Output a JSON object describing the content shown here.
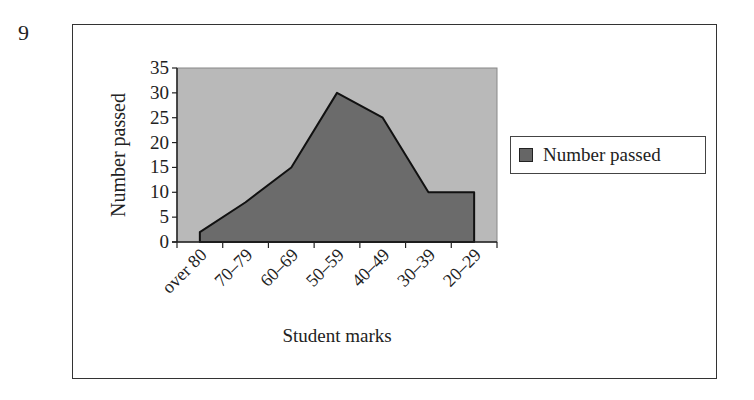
{
  "question_number": "9",
  "chart_data": {
    "type": "area",
    "title": "",
    "xlabel": "Student marks",
    "ylabel": "Number passed",
    "categories": [
      "over 80",
      "70–79",
      "60–69",
      "50–59",
      "40–49",
      "30–39",
      "20–29"
    ],
    "series": [
      {
        "name": "Number passed",
        "values": [
          2,
          8,
          15,
          30,
          25,
          10,
          10
        ]
      }
    ],
    "ylim": [
      0,
      35
    ],
    "yticks": [
      0,
      5,
      10,
      15,
      20,
      25,
      30,
      35
    ],
    "grid": false,
    "legend_position": "right",
    "colors": {
      "plot_bg": "#b9b9b9",
      "area_fill": "#6b6b6b",
      "outline": "#111111"
    }
  },
  "legend": {
    "label": "Number passed"
  }
}
